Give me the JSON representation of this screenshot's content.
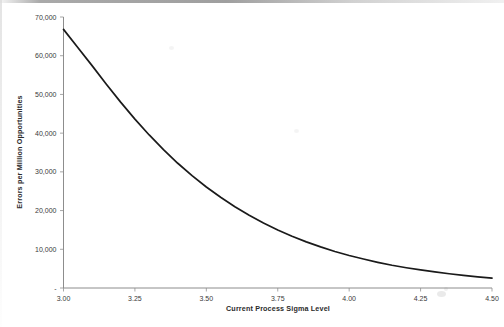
{
  "chart_data": {
    "type": "line",
    "title": "",
    "xlabel": "Current Process Sigma Level",
    "ylabel": "Errors per Million Opportunities",
    "xlim": [
      3.0,
      4.5
    ],
    "ylim": [
      0,
      70000
    ],
    "x_ticks": [
      "3.00",
      "3.25",
      "3.50",
      "3.75",
      "4.00",
      "4.25",
      "4.50"
    ],
    "x_tick_values": [
      3.0,
      3.25,
      3.5,
      3.75,
      4.0,
      4.25,
      4.5
    ],
    "y_ticks": [
      "-",
      "10,000",
      "20,000",
      "30,000",
      "40,000",
      "50,000",
      "60,000",
      "70,000"
    ],
    "y_tick_values": [
      0,
      10000,
      20000,
      30000,
      40000,
      50000,
      60000,
      70000
    ],
    "grid": false,
    "legend": false,
    "series": [
      {
        "name": "Errors per Million Opportunities",
        "color": "#1a1a1a",
        "x": [
          3.0,
          3.05,
          3.1,
          3.15,
          3.2,
          3.25,
          3.3,
          3.35,
          3.4,
          3.45,
          3.5,
          3.55,
          3.6,
          3.65,
          3.7,
          3.75,
          3.8,
          3.85,
          3.9,
          3.95,
          4.0,
          4.05,
          4.1,
          4.15,
          4.2,
          4.25,
          4.3,
          4.35,
          4.4,
          4.45,
          4.5
        ],
        "values": [
          66807,
          62097,
          57433,
          52616,
          48006,
          43633,
          39532,
          35726,
          32220,
          29013,
          26091,
          23432,
          21008,
          18793,
          16793,
          14987,
          13362,
          11911,
          10618,
          9442,
          8398,
          7478,
          6637,
          5876,
          5234,
          4661,
          4145,
          3681,
          3264,
          2890,
          2555
        ]
      }
    ]
  },
  "axes": {
    "y_axis_title": "Errors per Million Opportunities",
    "x_axis_title": "Current Process Sigma Level",
    "zero_label": "-"
  }
}
